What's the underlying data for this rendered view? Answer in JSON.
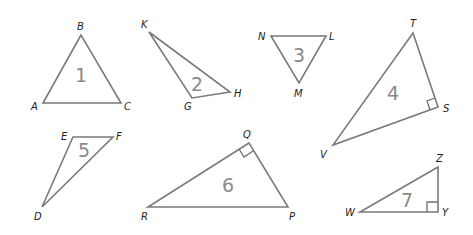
{
  "diagram": {
    "stroke_color": "#7a7a7a",
    "number_color": "#8a8a8a",
    "label_color": "#222222",
    "triangles": [
      {
        "id": "1",
        "number": "1",
        "vertices": {
          "B": [
            81,
            35
          ],
          "A": [
            43,
            103
          ],
          "C": [
            121,
            103
          ]
        },
        "vertex_labels": [
          "B",
          "A",
          "C"
        ],
        "right_angle_at": null
      },
      {
        "id": "2",
        "number": "2",
        "vertices": {
          "K": [
            149,
            32
          ],
          "G": [
            192,
            98
          ],
          "H": [
            230,
            92
          ]
        },
        "vertex_labels": [
          "K",
          "G",
          "H"
        ],
        "right_angle_at": null
      },
      {
        "id": "3",
        "number": "3",
        "vertices": {
          "N": [
            271,
            36
          ],
          "L": [
            326,
            36
          ],
          "M": [
            299,
            83
          ]
        },
        "vertex_labels": [
          "N",
          "L",
          "M"
        ],
        "right_angle_at": null
      },
      {
        "id": "4",
        "number": "4",
        "vertices": {
          "T": [
            413,
            33
          ],
          "S": [
            438,
            107
          ],
          "V": [
            333,
            145
          ]
        },
        "vertex_labels": [
          "T",
          "S",
          "V"
        ],
        "right_angle_at": "S"
      },
      {
        "id": "5",
        "number": "5",
        "vertices": {
          "E": [
            73,
            137
          ],
          "F": [
            113,
            137
          ],
          "D": [
            42,
            207
          ]
        },
        "vertex_labels": [
          "E",
          "F",
          "D"
        ],
        "right_angle_at": null
      },
      {
        "id": "6",
        "number": "6",
        "vertices": {
          "Q": [
            249,
            143
          ],
          "R": [
            148,
            207
          ],
          "P": [
            288,
            207
          ]
        },
        "vertex_labels": [
          "Q",
          "R",
          "P"
        ],
        "right_angle_at": "Q"
      },
      {
        "id": "7",
        "number": "7",
        "vertices": {
          "Z": [
            438,
            167
          ],
          "W": [
            360,
            212
          ],
          "Y": [
            438,
            212
          ]
        },
        "vertex_labels": [
          "Z",
          "W",
          "Y"
        ],
        "right_angle_at": "Y"
      }
    ],
    "labels": {
      "t1": {
        "B": "B",
        "A": "A",
        "C": "C",
        "num": "1"
      },
      "t2": {
        "K": "K",
        "G": "G",
        "H": "H",
        "num": "2"
      },
      "t3": {
        "N": "N",
        "L": "L",
        "M": "M",
        "num": "3"
      },
      "t4": {
        "T": "T",
        "S": "S",
        "V": "V",
        "num": "4"
      },
      "t5": {
        "E": "E",
        "F": "F",
        "D": "D",
        "num": "5"
      },
      "t6": {
        "Q": "Q",
        "R": "R",
        "P": "P",
        "num": "6"
      },
      "t7": {
        "Z": "Z",
        "W": "W",
        "Y": "Y",
        "num": "7"
      }
    }
  }
}
